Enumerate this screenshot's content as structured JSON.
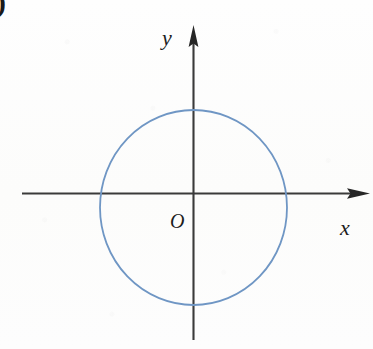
{
  "figure": {
    "canvas": {
      "width": 373,
      "height": 349,
      "background": "#fdfdfc"
    },
    "corner_artifact": {
      "text": ")",
      "note": "partial bracket clipped at top-left edge"
    },
    "labels": {
      "y_axis": "y",
      "x_axis": "x",
      "origin": "O"
    },
    "colors": {
      "axis": "#3a3a3a",
      "curve": "#6f96c4",
      "text": "#1d1d1d",
      "background": "#fdfdfc"
    }
  },
  "chart_data": {
    "type": "scatter",
    "title": "",
    "subtitle": "",
    "xlabel": "x",
    "ylabel": "y",
    "origin_label": "O",
    "grid": false,
    "legend": null,
    "axes": {
      "x": {
        "label": "x",
        "origin_px": 193,
        "pixel_start": 22,
        "pixel_end": 370,
        "arrow": "right",
        "ticks": [],
        "ticklabels": []
      },
      "y": {
        "label": "y",
        "origin_px": 208,
        "pixel_start": 25,
        "pixel_end": 340,
        "arrow": "up",
        "ticks": [],
        "ticklabels": []
      }
    },
    "shapes": [
      {
        "kind": "circle",
        "description": "circle centred at the origin",
        "center": [
          0,
          0
        ],
        "center_px": [
          193.5,
          207.5
        ],
        "radius_px_x": 93.5,
        "radius_px_y": 97.5,
        "stroke": "#6f96c4",
        "stroke_width": 1.8,
        "fill": "none",
        "x_intercepts_px": [
          100,
          287
        ],
        "y_intercepts_px": [
          110,
          305
        ]
      }
    ],
    "annotations": [
      {
        "text": "y",
        "px": [
          170,
          40
        ],
        "style": "italic-serif"
      },
      {
        "text": "x",
        "px": [
          347,
          229
        ],
        "style": "italic-serif"
      },
      {
        "text": "O",
        "px": [
          176,
          222
        ],
        "style": "italic-serif"
      }
    ]
  }
}
